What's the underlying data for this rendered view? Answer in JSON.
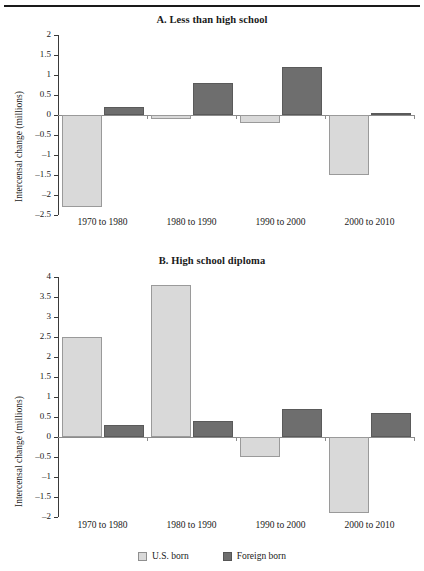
{
  "figure": {
    "ylabel": "Intercensal change (millions)",
    "colors": {
      "us_born": "#d9d9d9",
      "foreign_born": "#6e6e6e",
      "axis": "#3a3a3a",
      "zero_line": "#8c8c8c"
    }
  },
  "legend": {
    "items": [
      {
        "label": "U.S. born",
        "swatch": "light-gray-square-icon"
      },
      {
        "label": "Foreign born",
        "swatch": "dark-gray-square-icon"
      }
    ]
  },
  "chart_data": [
    {
      "type": "bar",
      "title": "A. Less than high school",
      "xlabel": "",
      "ylabel": "Intercensal change (millions)",
      "categories": [
        "1970 to 1980",
        "1980 to 1990",
        "1990 to 2000",
        "2000 to 2010"
      ],
      "series": [
        {
          "name": "U.S. born",
          "values": [
            -2.3,
            -0.1,
            -0.2,
            -1.5
          ],
          "color": "#d9d9d9"
        },
        {
          "name": "Foreign born",
          "values": [
            0.2,
            0.8,
            1.2,
            0.05
          ],
          "color": "#6e6e6e"
        }
      ],
      "ylim": [
        -2.5,
        2
      ],
      "yticks": [
        2,
        1.5,
        1,
        0.5,
        0,
        -0.5,
        -1,
        -1.5,
        -2,
        -2.5
      ],
      "yticklabels": [
        "2",
        "1.5",
        "1",
        "0.5",
        "0",
        "–0.5",
        "–1",
        "–1.5",
        "–2",
        "–2.5"
      ],
      "grid": false,
      "legend_position": "none"
    },
    {
      "type": "bar",
      "title": "B.  High school diploma",
      "xlabel": "",
      "ylabel": "Intercensal change (millions)",
      "categories": [
        "1970 to 1980",
        "1980 to 1990",
        "1990 to 2000",
        "2000 to 2010"
      ],
      "series": [
        {
          "name": "U.S. born",
          "values": [
            2.5,
            3.8,
            -0.5,
            -1.9
          ],
          "color": "#d9d9d9"
        },
        {
          "name": "Foreign born",
          "values": [
            0.3,
            0.4,
            0.7,
            0.6
          ],
          "color": "#6e6e6e"
        }
      ],
      "ylim": [
        -2,
        4
      ],
      "yticks": [
        4,
        3.5,
        3,
        2.5,
        2,
        1.5,
        1,
        0.5,
        0,
        -0.5,
        -1,
        -1.5,
        -2
      ],
      "yticklabels": [
        "4",
        "3.5",
        "3",
        "2.5",
        "2",
        "1.5",
        "1",
        "0.5",
        "0",
        "–0.5",
        "–1",
        "–1.5",
        "–2"
      ],
      "grid": false,
      "legend_position": "bottom"
    }
  ]
}
